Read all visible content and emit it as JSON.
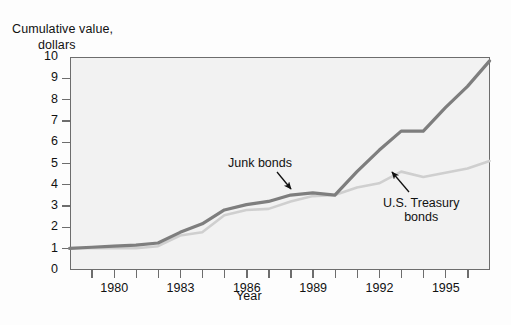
{
  "chart_data": {
    "type": "line",
    "title": "",
    "ylabel": "Cumulative value, dollars",
    "ylabel_line1": "Cumulative value,",
    "ylabel_line2": "dollars",
    "xlabel": "Year",
    "xlim": [
      1978,
      1997
    ],
    "ylim": [
      0,
      10
    ],
    "grid": false,
    "legend_position": "inline-annotations",
    "ytick_labels": [
      "0",
      "1",
      "2",
      "3",
      "4",
      "5",
      "6",
      "7",
      "8",
      "9",
      "10"
    ],
    "ytick_values": [
      0,
      1,
      2,
      3,
      4,
      5,
      6,
      7,
      8,
      9,
      10
    ],
    "xtick_values": [
      1978,
      1979,
      1980,
      1981,
      1982,
      1983,
      1984,
      1985,
      1986,
      1987,
      1988,
      1989,
      1990,
      1991,
      1992,
      1993,
      1994,
      1995,
      1996,
      1997
    ],
    "xtick_labels_shown": [
      "1980",
      "1983",
      "1986",
      "1989",
      "1992",
      "1995"
    ],
    "xtick_labels_shown_values": [
      1980,
      1983,
      1986,
      1989,
      1992,
      1995
    ],
    "x": [
      1978,
      1979,
      1980,
      1981,
      1982,
      1983,
      1984,
      1985,
      1986,
      1987,
      1988,
      1989,
      1990,
      1991,
      1992,
      1993,
      1994,
      1995,
      1996,
      1997
    ],
    "series": [
      {
        "name": "Junk bonds",
        "color": "#7e7e7e",
        "values": [
          1.0,
          1.05,
          1.1,
          1.15,
          1.25,
          1.75,
          2.15,
          2.8,
          3.05,
          3.2,
          3.5,
          3.6,
          3.5,
          4.6,
          5.6,
          6.5,
          6.5,
          7.6,
          8.6,
          9.8
        ]
      },
      {
        "name": "U.S. Treasury bonds",
        "color": "#cfcfcf",
        "values": [
          1.0,
          1.0,
          1.0,
          1.0,
          1.1,
          1.6,
          1.75,
          2.55,
          2.8,
          2.85,
          3.2,
          3.45,
          3.5,
          3.85,
          4.05,
          4.6,
          4.35,
          4.55,
          4.75,
          5.1
        ]
      }
    ],
    "annotations": [
      {
        "label": "Junk bonds",
        "target_series": "Junk bonds",
        "text_x": 228,
        "text_y": 156,
        "arrow_from": [
          277,
          172
        ],
        "arrow_to": [
          291,
          189
        ]
      },
      {
        "label_line1": "U.S. Treasury",
        "label_line2": "bonds",
        "target_series": "U.S. Treasury bonds",
        "text_x": 383,
        "text_y": 196,
        "arrow_from": [
          409,
          192
        ],
        "arrow_to": [
          392,
          172
        ]
      }
    ]
  },
  "colors": {
    "junk_bonds": "#7e7e7e",
    "treasury_bonds": "#cfcfcf",
    "axis": "#6d6d6d",
    "plot_background": "#f2f2f2",
    "text": "#111111"
  }
}
